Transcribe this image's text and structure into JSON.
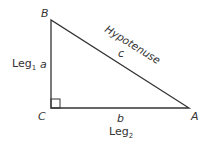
{
  "diagram": {
    "vertices": {
      "B": "B",
      "C": "C",
      "A": "A"
    },
    "sides": {
      "a": "a",
      "b": "b",
      "c": "c"
    },
    "labels": {
      "hypotenuse": "Hypotenuse",
      "leg1": "Leg",
      "leg1_sub": "1",
      "leg2": "Leg",
      "leg2_sub": "2"
    },
    "colors": {
      "line": "#333333",
      "background": "#ffffff"
    }
  }
}
